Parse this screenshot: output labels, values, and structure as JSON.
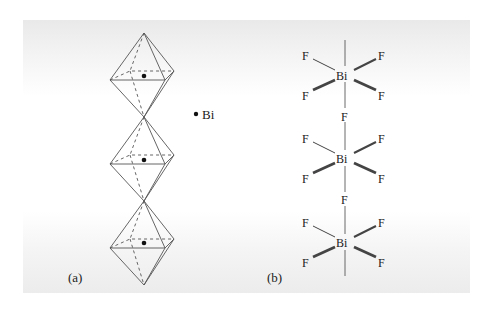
{
  "figure": {
    "panel_a": {
      "label": "(a)",
      "legend": {
        "marker": "filled-dot",
        "text": "Bi"
      },
      "octahedra_count": 3,
      "description": "Chain of corner-sharing octahedra with Bi at each center"
    },
    "panel_b": {
      "label": "(b)",
      "units": [
        {
          "center": "Bi",
          "equatorial": [
            "F",
            "F",
            "F",
            "F"
          ]
        },
        {
          "center": "Bi",
          "equatorial": [
            "F",
            "F",
            "F",
            "F"
          ]
        },
        {
          "center": "Bi",
          "equatorial": [
            "F",
            "F",
            "F",
            "F"
          ]
        }
      ],
      "bridging": [
        "F",
        "F"
      ]
    }
  },
  "colors": {
    "line": "#555555",
    "text": "#222222",
    "dot": "#111111"
  }
}
